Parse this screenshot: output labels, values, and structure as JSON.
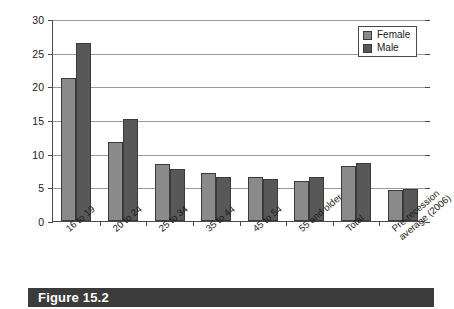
{
  "figure": {
    "caption": "Figure 15.2"
  },
  "legend": {
    "position": "top-right",
    "items": [
      {
        "label": "Female",
        "color": "#8a8a8a",
        "swatch": "female-swatch"
      },
      {
        "label": "Male",
        "color": "#585858",
        "swatch": "male-swatch"
      }
    ]
  },
  "axes": {
    "y_ticks": [
      "0",
      "5",
      "10",
      "15",
      "20",
      "25",
      "30"
    ],
    "y_min": 0,
    "y_max": 30,
    "y_step": 5
  },
  "chart_data": {
    "type": "bar",
    "title": "Figure 15.2",
    "xlabel": "",
    "ylabel": "",
    "ylim": [
      0,
      30
    ],
    "ytick_values": [
      0,
      5,
      10,
      15,
      20,
      25,
      30
    ],
    "grid": true,
    "legend_position": "top-right",
    "categories": [
      "16 to 19",
      "20 to 24",
      "25 to 34",
      "35 to 44",
      "45 to 54",
      "55 and older",
      "Total",
      "Pre-recession\naverage (2006)"
    ],
    "category_labels_display": [
      "16 to 19",
      "20 to 24",
      "25 to 34",
      "35 to 44",
      "45 to 54",
      "55 and older",
      "Total",
      "Pre-recession\naverage (2006)"
    ],
    "series": [
      {
        "name": "Female",
        "color": "#8a8a8a",
        "values": [
          21.2,
          11.8,
          8.5,
          7.2,
          6.6,
          5.9,
          8.1,
          4.6
        ]
      },
      {
        "name": "Male",
        "color": "#585858",
        "values": [
          26.4,
          15.1,
          7.7,
          6.5,
          6.3,
          6.5,
          8.6,
          4.7
        ]
      }
    ]
  }
}
